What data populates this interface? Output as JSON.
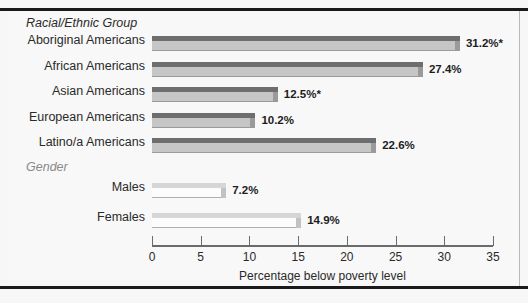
{
  "chart_data": {
    "type": "bar",
    "orientation": "horizontal",
    "title": "",
    "xlabel": "Percentage below poverty level",
    "ylabel": "",
    "xlim": [
      0,
      35
    ],
    "xticks": [
      0,
      5,
      10,
      15,
      20,
      25,
      30,
      35
    ],
    "grid": false,
    "legend": "none",
    "groups": [
      {
        "header": "Racial/Ethnic Group",
        "style": "dark",
        "items": [
          {
            "label": "Aboriginal Americans",
            "value": 31.2,
            "value_label": "31.2%*"
          },
          {
            "label": "African Americans",
            "value": 27.4,
            "value_label": "27.4%"
          },
          {
            "label": "Asian Americans",
            "value": 12.5,
            "value_label": "12.5%*"
          },
          {
            "label": "European Americans",
            "value": 10.2,
            "value_label": "10.2%"
          },
          {
            "label": "Latino/a Americans",
            "value": 22.6,
            "value_label": "22.6%"
          }
        ]
      },
      {
        "header": "Gender",
        "style": "light",
        "items": [
          {
            "label": "Males",
            "value": 7.2,
            "value_label": "7.2%"
          },
          {
            "label": "Females",
            "value": 14.9,
            "value_label": "14.9%"
          }
        ]
      }
    ],
    "categories": [
      "Aboriginal Americans",
      "African Americans",
      "Asian Americans",
      "European Americans",
      "Latino/a Americans",
      "Males",
      "Females"
    ],
    "values": [
      31.2,
      27.4,
      12.5,
      10.2,
      22.6,
      7.2,
      14.9
    ],
    "annotations": [
      "* denotes asterisked value"
    ],
    "colors": {
      "bar_dark_face": "#c6c6c6",
      "bar_dark_top": "#6e6e6e",
      "bar_light_face": "#fcfcfc",
      "bar_light_top": "#d6d6d6",
      "axis": "#6b6b6b",
      "background": "#f8f8f8",
      "text": "#2a2a2a",
      "header_muted": "#8a8a8a"
    }
  }
}
